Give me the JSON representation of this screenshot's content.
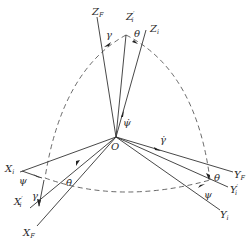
{
  "diagram": {
    "type": "coordinate-frame rotation diagram",
    "origin_label": "O",
    "z_axes": [
      {
        "id": "ZF",
        "base": "Z",
        "sub": "F",
        "prime": ""
      },
      {
        "id": "Zi_prime",
        "base": "Z",
        "sub": "i",
        "prime": "′"
      },
      {
        "id": "Zi",
        "base": "Z",
        "sub": "i",
        "prime": ""
      }
    ],
    "x_axes": [
      {
        "id": "Xi",
        "base": "X",
        "sub": "i",
        "prime": ""
      },
      {
        "id": "Xi_prime",
        "base": "X",
        "sub": "i",
        "prime": "′"
      },
      {
        "id": "XF",
        "base": "X",
        "sub": "F",
        "prime": ""
      }
    ],
    "y_axes": [
      {
        "id": "YF",
        "base": "Y",
        "sub": "F",
        "prime": ""
      },
      {
        "id": "Yi_prime",
        "base": "Y",
        "sub": "i",
        "prime": "′"
      },
      {
        "id": "Yi",
        "base": "Y",
        "sub": "i",
        "prime": ""
      }
    ],
    "angles": {
      "gamma": "γ",
      "theta": "θ",
      "psi": "ψ"
    },
    "rates": {
      "psi_dot": "ψ̇",
      "gamma_dot": "γ̇",
      "theta_dot": "θ̇"
    },
    "colors": {
      "line": "#333333",
      "text": "#2a2a2a",
      "background": "#ffffff"
    }
  }
}
